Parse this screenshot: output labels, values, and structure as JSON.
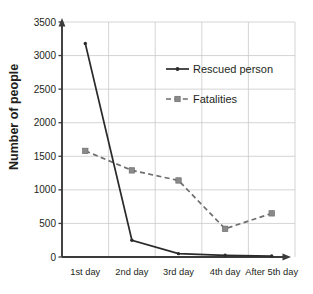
{
  "chart_data": {
    "type": "line",
    "title": "",
    "xlabel": "",
    "ylabel": "Number of people",
    "categories": [
      "1st day",
      "2nd day",
      "3rd day",
      "4th day",
      "After 5th day"
    ],
    "series": [
      {
        "name": "Rescued person",
        "values": [
          3180,
          250,
          50,
          25,
          15
        ],
        "line_style": "solid",
        "marker": "round",
        "color": "#2b2b2b"
      },
      {
        "name": "Fatalities",
        "values": [
          1580,
          1290,
          1140,
          420,
          650
        ],
        "line_style": "dashed",
        "marker": "square",
        "color": "#6e6e6e"
      }
    ],
    "ylim": [
      0,
      3500
    ],
    "ytick_values": [
      0,
      500,
      1000,
      1500,
      2000,
      2500,
      3000,
      3500
    ],
    "ytick_labels": [
      "0",
      "500",
      "1000",
      "1500",
      "2000",
      "2500",
      "3000",
      "3500"
    ],
    "grid": true,
    "grid_horizontal": true,
    "grid_vertical": true,
    "legend_position": "upper-right-inside",
    "axis_arrows": true
  },
  "legend": {
    "entries": [
      {
        "label": "Rescued person"
      },
      {
        "label": "Fatalities"
      }
    ]
  },
  "colors": {
    "rescued": "#2b2b2b",
    "fatalities": "#6e6e6e",
    "grid": "#c9c9c9",
    "axis": "#3b3b3b",
    "text": "#231f20",
    "background": "#ffffff"
  }
}
